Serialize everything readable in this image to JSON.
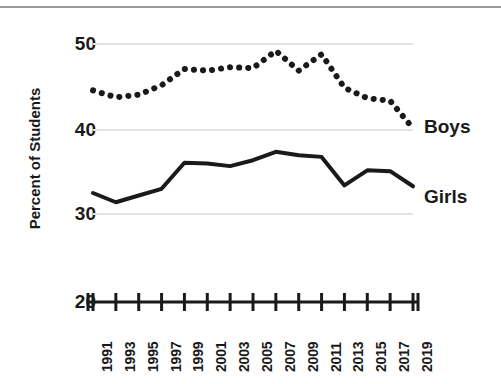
{
  "chart_data": {
    "type": "line",
    "title": "",
    "subtitle": "",
    "xlabel": "",
    "ylabel": "Percent of Students",
    "ylim": [
      20,
      50
    ],
    "yticks": [
      20,
      30,
      40,
      50
    ],
    "ytick_labels": [
      "20",
      "30",
      "40",
      "50"
    ],
    "grid": true,
    "grid_axis": "y",
    "legend_position": "right-inline",
    "x": [
      1991,
      1993,
      1995,
      1997,
      1999,
      2001,
      2003,
      2005,
      2007,
      2009,
      2011,
      2013,
      2015,
      2017,
      2019
    ],
    "categories": [
      "1991",
      "1993",
      "1995",
      "1997",
      "1999",
      "2001",
      "2003",
      "2005",
      "2007",
      "2009",
      "2011",
      "2013",
      "2015",
      "2017",
      "2019"
    ],
    "series": [
      {
        "name": "Boys",
        "style": "dotted",
        "color": "#1a1a1a",
        "values": [
          44.6,
          43.8,
          44.1,
          45.2,
          47.1,
          46.9,
          47.3,
          47.2,
          49.2,
          46.9,
          48.8,
          44.9,
          43.7,
          43.4,
          40.2
        ]
      },
      {
        "name": "Girls",
        "style": "solid",
        "color": "#1a1a1a",
        "values": [
          32.5,
          31.4,
          32.2,
          33.0,
          36.1,
          36.0,
          35.7,
          36.4,
          37.4,
          37.0,
          36.8,
          33.4,
          35.2,
          35.1,
          33.3
        ]
      }
    ],
    "annotations": [
      {
        "text": "Boys",
        "anchor_year": 2019,
        "anchor_value": 40.2
      },
      {
        "text": "Girls",
        "anchor_year": 2019,
        "anchor_value": 33.3
      }
    ]
  },
  "axis": {
    "y_title": "Percent of Students",
    "y_labels": [
      "50",
      "40",
      "30",
      "20"
    ],
    "x_labels": [
      "1991",
      "1993",
      "1995",
      "1997",
      "1999",
      "2001",
      "2003",
      "2005",
      "2007",
      "2009",
      "2011",
      "2013",
      "2015",
      "2017",
      "2019"
    ]
  },
  "legend": {
    "boys": "Boys",
    "girls": "Girls"
  }
}
